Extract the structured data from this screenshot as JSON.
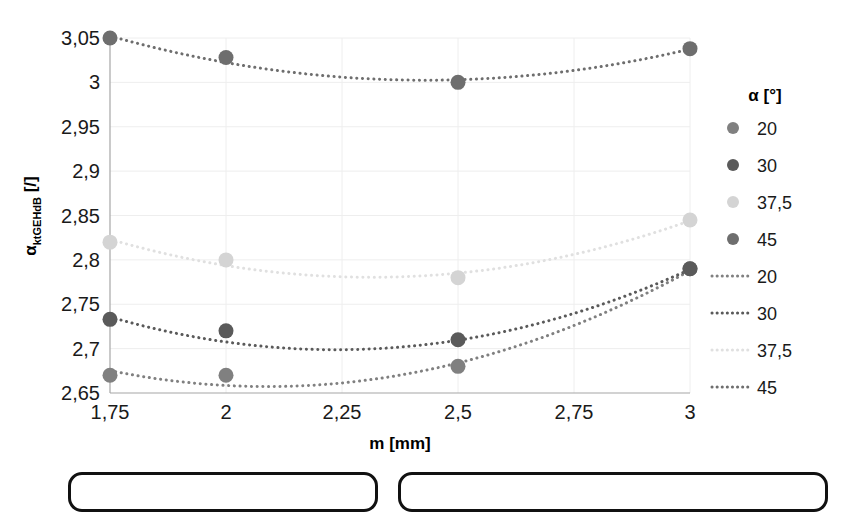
{
  "chart_data": {
    "type": "scatter",
    "title": "",
    "xlabel": "m [mm]",
    "ylabel": "αktGEHdB [/]",
    "ylabel_main": "α",
    "ylabel_sub": "ktGEHdB",
    "ylabel_unit": " [/]",
    "x": [
      1.75,
      2,
      2.5,
      3
    ],
    "xlim": [
      1.75,
      3
    ],
    "ylim": [
      2.65,
      3.05
    ],
    "xticks": [
      "1,75",
      "2",
      "2,25",
      "2,5",
      "2,75",
      "3"
    ],
    "xtick_values": [
      1.75,
      2,
      2.25,
      2.5,
      2.75,
      3
    ],
    "yticks": [
      "2,65",
      "2,7",
      "2,75",
      "2,8",
      "2,85",
      "2,9",
      "2,95",
      "3",
      "3,05"
    ],
    "ytick_values": [
      2.65,
      2.7,
      2.75,
      2.8,
      2.85,
      2.9,
      2.95,
      3.0,
      3.05
    ],
    "grid": true,
    "legend_position": "right",
    "legend_title": "α [°]",
    "series": [
      {
        "name": "20",
        "color": "#808080",
        "marker": "circle",
        "x": [
          1.75,
          2,
          2.5,
          3
        ],
        "values": [
          2.67,
          2.67,
          2.68,
          2.79
        ],
        "trend": [
          2.671,
          2.6665,
          2.6785,
          2.7895
        ]
      },
      {
        "name": "30",
        "color": "#5a5a5a",
        "marker": "circle",
        "x": [
          1.75,
          2,
          2.5,
          3
        ],
        "values": [
          2.733,
          2.72,
          2.71,
          2.79
        ],
        "trend": [
          2.7325,
          2.7135,
          2.7055,
          2.7905
        ]
      },
      {
        "name": "37,5",
        "color": "#d4d4d4",
        "marker": "circle",
        "x": [
          1.75,
          2,
          2.5,
          3
        ],
        "values": [
          2.82,
          2.8,
          2.78,
          2.845
        ],
        "trend": [
          2.8195,
          2.8005,
          2.7805,
          2.8455
        ]
      },
      {
        "name": "45",
        "color": "#6e6e6e",
        "marker": "circle",
        "x": [
          1.75,
          2,
          2.5,
          3
        ],
        "values": [
          3.05,
          3.028,
          3.0,
          3.038
        ],
        "trend": [
          3.0495,
          3.0275,
          2.9995,
          3.0385
        ]
      }
    ],
    "trendlines": [
      {
        "name": "20",
        "color": "#808080",
        "style": "dotted"
      },
      {
        "name": "30",
        "color": "#5a5a5a",
        "style": "dotted"
      },
      {
        "name": "37,5",
        "color": "#e0e0e0",
        "style": "dotted"
      },
      {
        "name": "45",
        "color": "#6e6e6e",
        "style": "dotted"
      }
    ]
  },
  "legend": {
    "title": "α [°]",
    "marker_items": [
      {
        "label": "20",
        "color": "#808080"
      },
      {
        "label": "30",
        "color": "#5a5a5a"
      },
      {
        "label": "37,5",
        "color": "#d4d4d4"
      },
      {
        "label": "45",
        "color": "#6e6e6e"
      }
    ],
    "line_items": [
      {
        "label": "20",
        "color": "#808080"
      },
      {
        "label": "30",
        "color": "#5a5a5a"
      },
      {
        "label": "37,5",
        "color": "#e0e0e0"
      },
      {
        "label": "45",
        "color": "#6e6e6e"
      }
    ]
  },
  "bottom_shapes": {
    "left_box": "",
    "right_box": ""
  }
}
